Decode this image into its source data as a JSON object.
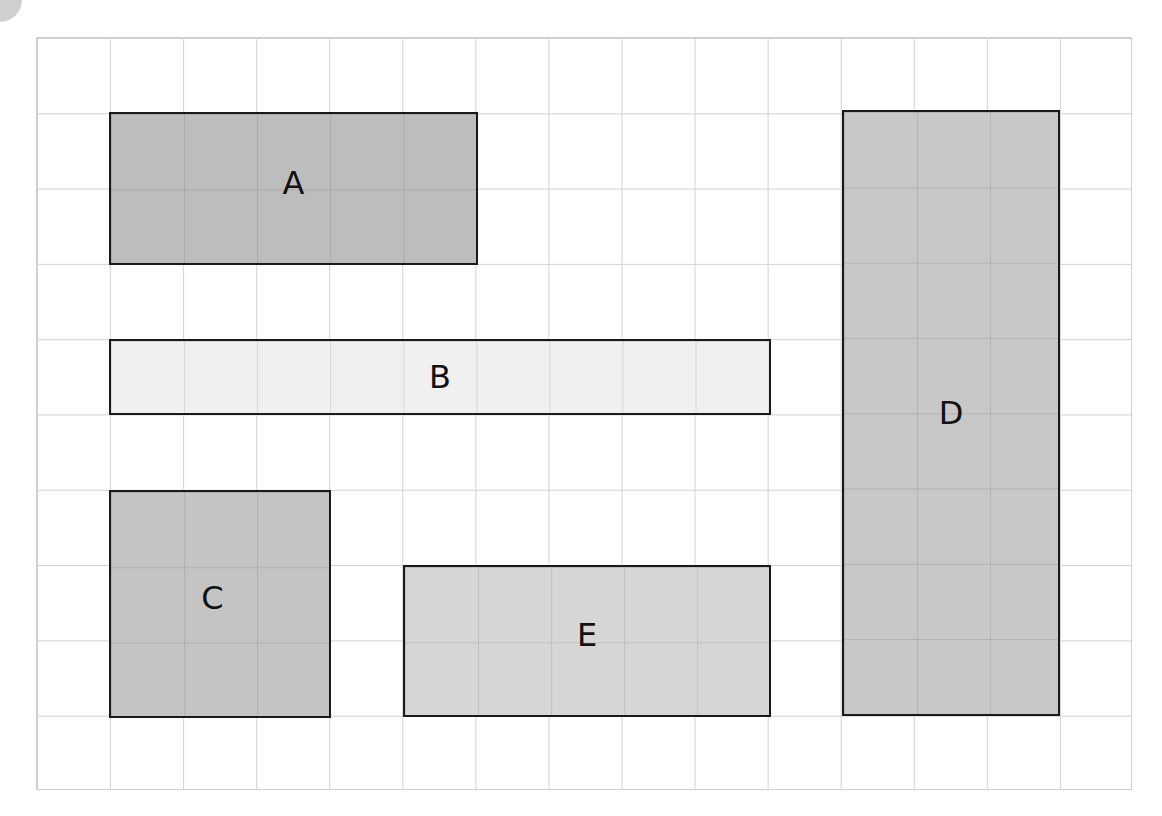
{
  "diagram": {
    "grid": {
      "columns": 15,
      "rows": 10,
      "line_color": "#d2d2d2"
    },
    "shapes": [
      {
        "label": "A",
        "col": 1,
        "row": 1,
        "width_cells": 5,
        "height_cells": 2,
        "fill": "#bdbdbd"
      },
      {
        "label": "B",
        "col": 1,
        "row": 4,
        "width_cells": 9,
        "height_cells": 1,
        "fill": "#f0f0f0"
      },
      {
        "label": "C",
        "col": 1,
        "row": 6,
        "width_cells": 3,
        "height_cells": 3,
        "fill": "#c4c4c4"
      },
      {
        "label": "D",
        "col": 11,
        "row": 1,
        "width_cells": 3,
        "height_cells": 8,
        "fill": "#c8c8c8"
      },
      {
        "label": "E",
        "col": 5,
        "row": 7,
        "width_cells": 5,
        "height_cells": 2,
        "fill": "#d6d6d6"
      }
    ]
  }
}
